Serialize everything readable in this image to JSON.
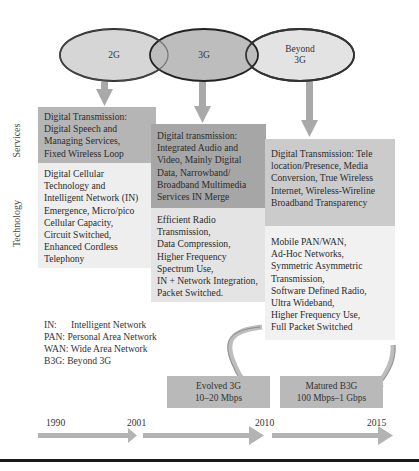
{
  "generations": [
    {
      "label": "2G"
    },
    {
      "label": "3G"
    },
    {
      "label_lines": [
        "Beyond",
        "3G"
      ]
    }
  ],
  "row_labels": {
    "services": "Services",
    "technology": "Technology"
  },
  "columns": [
    {
      "id": "2g",
      "services": [
        "Digital Transmission:",
        "Digital Speech and",
        "Managing Services,",
        "Fixed Wireless Loop"
      ],
      "technology": [
        "Digital Cellular",
        "Technology and",
        "Intelligent Network (IN)",
        "Emergence, Micro/pico",
        "Cellular Capacity,",
        "Circuit Switched,",
        "Enhanced Cordless",
        "Telephony"
      ]
    },
    {
      "id": "3g",
      "services": [
        "Digital transmission:",
        "Integrated Audio and",
        "Video, Mainly Digital",
        "Data, Narrowband/",
        "Broadband Multimedia",
        "Services IN Merge"
      ],
      "technology": [
        "Efficient Radio",
        "Transmission,",
        "Data Compression,",
        "Higher Frequency",
        "Spectrum Use,",
        "IN + Network Integration,",
        "Packet Switched."
      ]
    },
    {
      "id": "b3g",
      "services": [
        "Digital Transmission: Tele",
        "location/Presence, Media",
        "Conversion, True Wireless",
        "Internet, Wireless-Wireline",
        "Broadband Transparency"
      ],
      "technology": [
        "Mobile PAN/WAN,",
        "Ad-Hoc Networks,",
        "Symmetric Asymmetric",
        "Transmission,",
        "Software Defined Radio,",
        "Ultra Wideband,",
        "Higher Frequency Use,",
        "Full Packet Switched"
      ]
    }
  ],
  "legend": [
    {
      "abbr": "IN:",
      "text": "Intelligent Network"
    },
    {
      "abbr": "PAN:",
      "text": "Personal Area Network"
    },
    {
      "abbr": "WAN:",
      "text": "Wide Area Network"
    },
    {
      "abbr": "B3G:",
      "text": "Beyond 3G"
    }
  ],
  "speeds": [
    {
      "title": "Evolved 3G",
      "rate": "10–20 Mbps"
    },
    {
      "title": "Matured B3G",
      "rate": "100 Mbps–1 Gbps"
    }
  ],
  "timeline": {
    "years": [
      "1990",
      "2001",
      "2010",
      "2015"
    ]
  },
  "colors": {
    "arrow": "#a9a9a9",
    "oval_stroke": "#222222",
    "services_2g": "#b5b5b5",
    "services_3g": "#a6a6a6",
    "services_b3g": "#cbcbcb",
    "technology": "#eeeeee"
  }
}
